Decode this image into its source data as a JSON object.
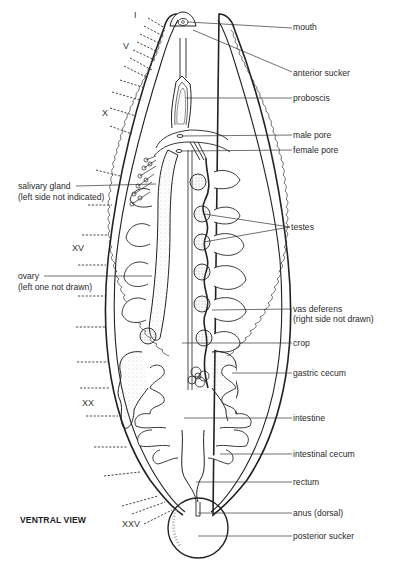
{
  "figure": {
    "title": "VENTRAL VIEW",
    "segment_markers": [
      "I",
      "V",
      "X",
      "XV",
      "XX",
      "XXV"
    ],
    "labels_right": [
      {
        "id": "mouth",
        "text": "mouth"
      },
      {
        "id": "anterior-sucker",
        "text": "anterior sucker"
      },
      {
        "id": "proboscis",
        "text": "proboscis"
      },
      {
        "id": "male-pore",
        "text": "male pore"
      },
      {
        "id": "female-pore",
        "text": "female pore"
      },
      {
        "id": "testes",
        "text": "testes"
      },
      {
        "id": "vas-deferens",
        "text": "vas deferens",
        "note": "(right side not drawn)"
      },
      {
        "id": "crop",
        "text": "crop"
      },
      {
        "id": "gastric-cecum",
        "text": "gastric cecum"
      },
      {
        "id": "intestine",
        "text": "intestine"
      },
      {
        "id": "intestinal-cecum",
        "text": "intestinal cecum"
      },
      {
        "id": "rectum",
        "text": "rectum"
      },
      {
        "id": "anus",
        "text": "anus (dorsal)"
      },
      {
        "id": "posterior-sucker",
        "text": "posterior sucker"
      }
    ],
    "labels_left": [
      {
        "id": "salivary-gland",
        "text": "salivary gland",
        "note": "(left side not indicated)"
      },
      {
        "id": "ovary",
        "text": "ovary",
        "note": "(left one not drawn)"
      }
    ]
  }
}
